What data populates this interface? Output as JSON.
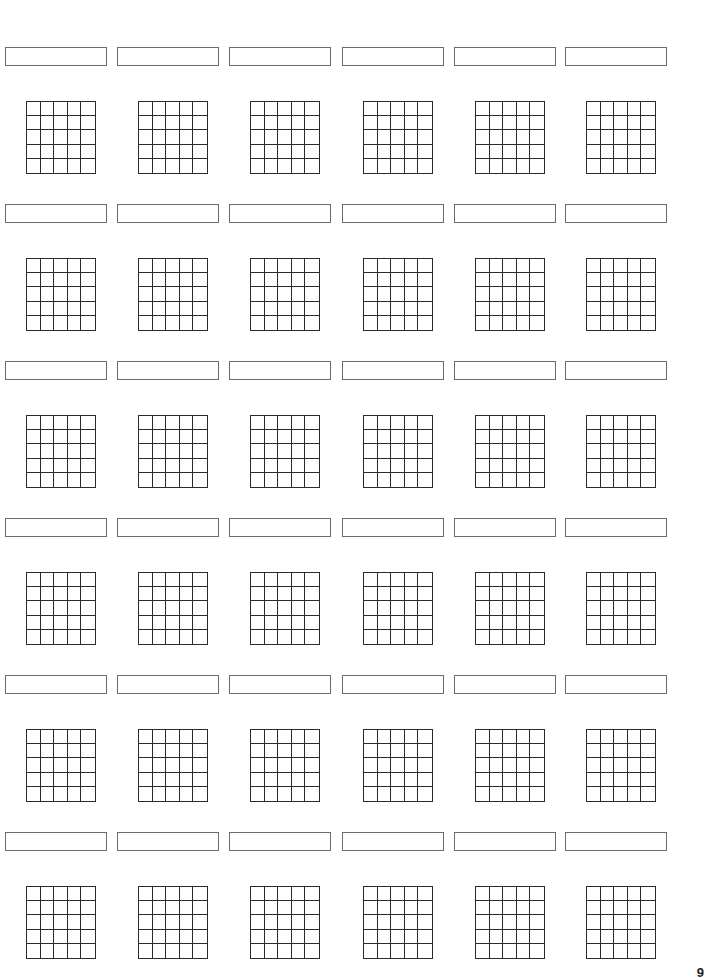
{
  "page": {
    "page_number": "9"
  },
  "layout": {
    "columns": 6,
    "rows": 6,
    "grid_cells_x": 5,
    "grid_cells_y": 5,
    "col_x": [
      5,
      117,
      229,
      342,
      454,
      565
    ],
    "row_y": [
      47,
      204,
      361,
      518,
      675,
      832
    ]
  },
  "diagrams": [
    {
      "name": ""
    },
    {
      "name": ""
    },
    {
      "name": ""
    },
    {
      "name": ""
    },
    {
      "name": ""
    },
    {
      "name": ""
    },
    {
      "name": ""
    },
    {
      "name": ""
    },
    {
      "name": ""
    },
    {
      "name": ""
    },
    {
      "name": ""
    },
    {
      "name": ""
    },
    {
      "name": ""
    },
    {
      "name": ""
    },
    {
      "name": ""
    },
    {
      "name": ""
    },
    {
      "name": ""
    },
    {
      "name": ""
    },
    {
      "name": ""
    },
    {
      "name": ""
    },
    {
      "name": ""
    },
    {
      "name": ""
    },
    {
      "name": ""
    },
    {
      "name": ""
    },
    {
      "name": ""
    },
    {
      "name": ""
    },
    {
      "name": ""
    },
    {
      "name": ""
    },
    {
      "name": ""
    },
    {
      "name": ""
    },
    {
      "name": ""
    },
    {
      "name": ""
    },
    {
      "name": ""
    },
    {
      "name": ""
    },
    {
      "name": ""
    },
    {
      "name": ""
    }
  ],
  "colors": {
    "box_border": "#6b6b6b",
    "grid_line": "#2a2a2a",
    "background": "#ffffff"
  }
}
